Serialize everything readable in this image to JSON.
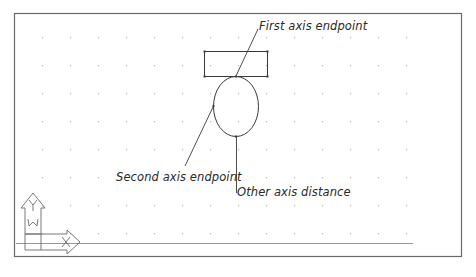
{
  "diagram": {
    "type": "cad-ellipse-axis-endpoint",
    "labels": {
      "first_axis_endpoint": "First axis endpoint",
      "second_axis_endpoint": "Second axis endpoint",
      "other_axis_distance": "Other axis distance"
    },
    "ucs_icon": {
      "y_axis_label": "Y",
      "x_axis_label": "X",
      "world_label": "W"
    },
    "grid": {
      "x_start": 42,
      "x_step": 28,
      "x_count": 14,
      "y_start": 37,
      "y_step": 28,
      "y_count": 8
    },
    "shapes": {
      "rectangle": {
        "x": 204,
        "y": 51,
        "width": 63,
        "height": 25
      },
      "ellipse": {
        "cx": 236,
        "cy": 106,
        "rx": 22,
        "ry": 30
      }
    },
    "colors": {
      "stroke": "#3a3a3a",
      "frame": "#6a6a6a",
      "grid_dot": "#b8b8b8"
    }
  }
}
